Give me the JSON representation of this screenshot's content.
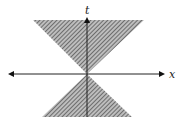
{
  "diagram": {
    "axes": {
      "t_label": "t",
      "x_label": "x"
    },
    "origin": {
      "x": 87,
      "y": 74
    },
    "colors": {
      "axis": "#222222",
      "hatch_fg": "#555555",
      "hatch_bg": "#bbbbbb",
      "background": "#ffffff"
    },
    "upper_cone": {
      "top_y": 20,
      "left_x": 33,
      "right_x": 144
    },
    "lower_cone": {
      "bottom_y": 117,
      "left_x": 42,
      "right_x": 132
    }
  }
}
